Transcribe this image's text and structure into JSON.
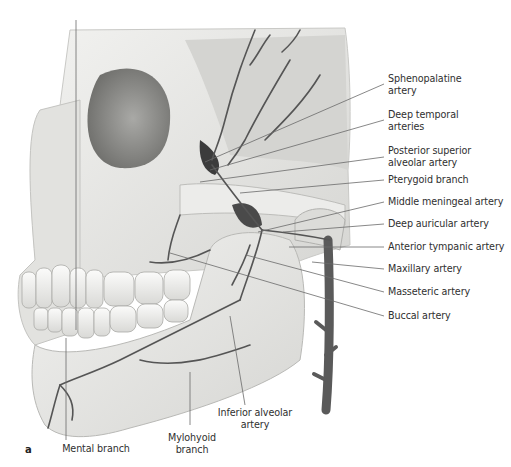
{
  "figure": {
    "panel_label": "a",
    "labels_right": [
      {
        "id": "sphenopalatine",
        "line1": "Sphenopalatine",
        "line2": "artery"
      },
      {
        "id": "deep-temporal",
        "line1": "Deep temporal",
        "line2": "arteries"
      },
      {
        "id": "posterior-superior-alveolar",
        "line1": "Posterior superior",
        "line2": "alveolar artery"
      },
      {
        "id": "pterygoid",
        "line1": "Pterygoid branch"
      },
      {
        "id": "middle-meningeal",
        "line1": "Middle meningeal artery"
      },
      {
        "id": "deep-auricular",
        "line1": "Deep auricular artery"
      },
      {
        "id": "anterior-tympanic",
        "line1": "Anterior tympanic artery"
      },
      {
        "id": "maxillary",
        "line1": "Maxillary artery"
      },
      {
        "id": "masseteric",
        "line1": "Masseteric artery"
      },
      {
        "id": "buccal",
        "line1": "Buccal artery"
      }
    ],
    "labels_bottom": [
      {
        "id": "mental",
        "line1": "Mental branch"
      },
      {
        "id": "mylohyoid",
        "line1": "Mylohyoid",
        "line2": "branch"
      },
      {
        "id": "inferior-alveolar",
        "line1": "Inferior alveolar",
        "line2": "artery"
      }
    ],
    "colors": {
      "bone": "#e9e9e7",
      "bone_shadow": "#b9b9b6",
      "artery": "#5f5f5f",
      "artery_dark": "#3d3d3d",
      "leader_line": "#6a6a6a",
      "text": "#2f2f2f"
    }
  }
}
